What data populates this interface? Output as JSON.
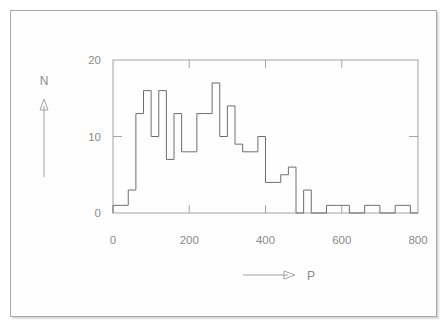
{
  "figure": {
    "kind": "histogram-figure",
    "background_color": "#ffffff",
    "border_color": "#a8a8a8",
    "line_color": "#6e6e6e",
    "text_color": "#8a8a8a"
  },
  "axes": {
    "y_axis_name": "N",
    "y_axis_arrow": "up-arrow",
    "x_axis_name": "P",
    "x_axis_arrow": "right-arrow",
    "y_tick_labels": [
      "0",
      "10",
      "20"
    ],
    "x_tick_labels": [
      "0",
      "200",
      "400",
      "600",
      "800"
    ]
  },
  "chart_data": {
    "type": "bar",
    "title": "",
    "subtitle": "",
    "xlabel": "P",
    "ylabel": "N",
    "xlim": [
      0,
      800
    ],
    "ylim": [
      0,
      20
    ],
    "xticks": [
      0,
      200,
      400,
      600,
      800
    ],
    "yticks": [
      0,
      10,
      20
    ],
    "grid": false,
    "legend": null,
    "legend_position": "none",
    "bin_width": 20,
    "histogram_style": "step-outline",
    "bin_edges": [
      0,
      20,
      40,
      60,
      80,
      100,
      120,
      140,
      160,
      180,
      200,
      220,
      240,
      260,
      280,
      300,
      320,
      340,
      360,
      380,
      400,
      420,
      440,
      460,
      480,
      500,
      520,
      540,
      560,
      580,
      600,
      620,
      640,
      660,
      680,
      700,
      720,
      740,
      760,
      780,
      800
    ],
    "categories": [
      "0-20",
      "20-40",
      "40-60",
      "60-80",
      "80-100",
      "100-120",
      "120-140",
      "140-160",
      "160-180",
      "180-200",
      "200-220",
      "220-240",
      "240-260",
      "260-280",
      "280-300",
      "300-320",
      "320-340",
      "340-360",
      "360-380",
      "380-400",
      "400-420",
      "420-440",
      "440-460",
      "460-480",
      "480-500",
      "500-520",
      "520-540",
      "540-560",
      "560-580",
      "580-600",
      "600-620",
      "620-640",
      "640-660",
      "660-680",
      "680-700",
      "700-720",
      "720-740",
      "740-760",
      "760-780",
      "780-800"
    ],
    "values": [
      1,
      1,
      3,
      13,
      16,
      10,
      16,
      7,
      13,
      8,
      8,
      13,
      13,
      17,
      10,
      14,
      9,
      8,
      8,
      10,
      4,
      4,
      5,
      6,
      0,
      3,
      0,
      0,
      1,
      1,
      1,
      0,
      0,
      1,
      1,
      0,
      0,
      1,
      1,
      0
    ]
  }
}
